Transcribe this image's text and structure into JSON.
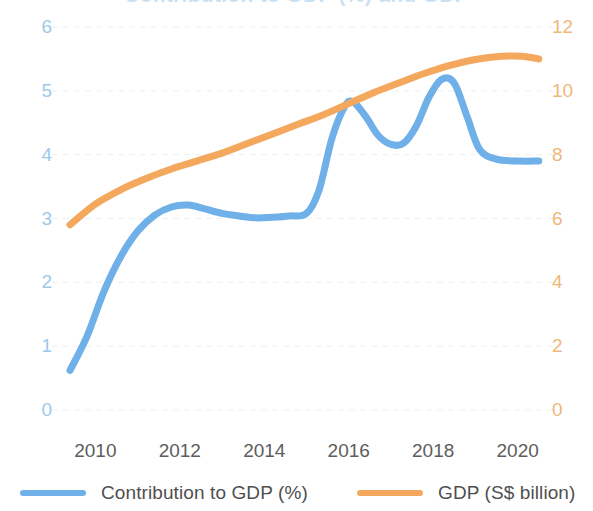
{
  "chart_data": {
    "type": "line",
    "title": "",
    "xlabel": "",
    "grid": true,
    "legend_position": "bottom",
    "x_ticks": [
      "2010",
      "2012",
      "2014",
      "2016",
      "2018",
      "2020"
    ],
    "x_tick_values": [
      2010,
      2012,
      2014,
      2016,
      2018,
      2020
    ],
    "xlim": [
      2009.4,
      2020.6
    ],
    "axes": [
      {
        "id": "left",
        "label": "Contribution to GDP (%)",
        "color": "#9dc9ea",
        "ylim": [
          0,
          6
        ],
        "ticks": [
          "0",
          "1",
          "2",
          "3",
          "4",
          "5",
          "6"
        ],
        "tick_values": [
          0,
          1,
          2,
          3,
          4,
          5,
          6
        ]
      },
      {
        "id": "right",
        "label": "GDP (S$ billion)",
        "color": "#f0b77a",
        "ylim": [
          0,
          12
        ],
        "ticks": [
          "0",
          "2",
          "4",
          "6",
          "8",
          "10",
          "12"
        ],
        "tick_values": [
          0,
          2,
          4,
          6,
          8,
          10,
          12
        ]
      }
    ],
    "series": [
      {
        "name": "Contribution to GDP (%)",
        "color": "#6fb0e8",
        "axis": "left",
        "x": [
          2009.4,
          2009.8,
          2010.2,
          2010.6,
          2011.0,
          2011.4,
          2011.8,
          2012.2,
          2012.6,
          2013.0,
          2013.4,
          2013.8,
          2014.2,
          2014.6,
          2015.0,
          2015.3,
          2015.6,
          2015.9,
          2016.1,
          2016.4,
          2016.7,
          2017.0,
          2017.3,
          2017.6,
          2017.9,
          2018.2,
          2018.5,
          2018.8,
          2019.1,
          2019.5,
          2020.0,
          2020.5
        ],
        "values": [
          0.62,
          1.15,
          1.85,
          2.4,
          2.8,
          3.05,
          3.18,
          3.21,
          3.15,
          3.08,
          3.04,
          3.01,
          3.02,
          3.04,
          3.08,
          3.45,
          4.25,
          4.75,
          4.83,
          4.6,
          4.3,
          4.16,
          4.18,
          4.45,
          4.9,
          5.18,
          5.12,
          4.6,
          4.08,
          3.93,
          3.9,
          3.9
        ]
      },
      {
        "name": "GDP (S$ billion)",
        "color": "#f4a85e",
        "axis": "right",
        "x": [
          2009.4,
          2010.0,
          2010.6,
          2011.2,
          2011.8,
          2012.4,
          2013.0,
          2013.6,
          2014.2,
          2014.8,
          2015.4,
          2016.0,
          2016.6,
          2017.2,
          2017.8,
          2018.4,
          2019.0,
          2019.6,
          2020.1,
          2020.5
        ],
        "values": [
          5.8,
          6.45,
          6.9,
          7.25,
          7.55,
          7.8,
          8.05,
          8.35,
          8.65,
          8.95,
          9.25,
          9.6,
          9.95,
          10.25,
          10.55,
          10.8,
          10.98,
          11.08,
          11.08,
          11.0
        ]
      }
    ]
  },
  "legend": {
    "items": [
      {
        "label": "Contribution to GDP (%)",
        "color": "#6fb0e8"
      },
      {
        "label": "GDP (S$ billion)",
        "color": "#f4a85e"
      }
    ]
  },
  "title_sliver": {
    "text": "Contribution to GDP (%) and GDP"
  }
}
